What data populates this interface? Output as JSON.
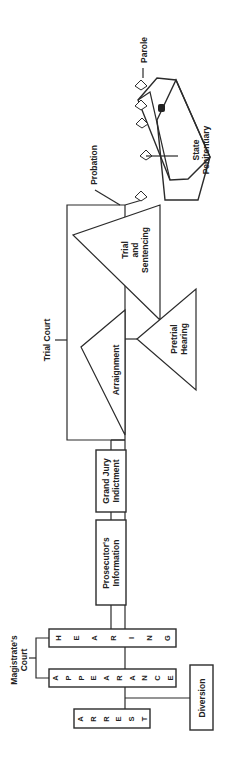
{
  "diagram": {
    "orientation": "rotated 90 degrees counter-clockwise",
    "colors": {
      "line": "#2b2b2b",
      "text": "#222222",
      "background": "#ffffff"
    },
    "groups": {
      "magistrates_court": {
        "line1": "Magistrate's",
        "line2": "Court"
      },
      "trial_court": {
        "label": "Trial Court"
      }
    },
    "nodes": {
      "arrest": {
        "letters": [
          "A",
          "R",
          "R",
          "E",
          "S",
          "T"
        ],
        "label": "ARREST"
      },
      "appearance": {
        "letters": [
          "A",
          "P",
          "P",
          "E",
          "A",
          "R",
          "A",
          "N",
          "C",
          "E"
        ],
        "label": "APPEARANCE"
      },
      "hearing": {
        "letters": [
          "H",
          "E",
          "A",
          "R",
          "I",
          "N",
          "G"
        ],
        "label": "HEARING"
      },
      "diversion": {
        "label": "Diversion"
      },
      "prosecutors_information": {
        "line1": "Prosecutor's",
        "line2": "Information"
      },
      "grand_jury_indictment": {
        "line1": "Grand Jury",
        "line2": "Indictment"
      },
      "arraignment": {
        "label": "Arraignment"
      },
      "pretrial_hearing": {
        "line1": "Pretrial",
        "line2": "Hearing"
      },
      "trial_and_sentencing": {
        "line1": "Trial",
        "line2": "and",
        "line3": "Sentencing"
      },
      "probation": {
        "label": "Probation"
      },
      "state_penitentiary": {
        "line1": "State",
        "line2": "Penitentiary"
      },
      "parole": {
        "label": "Parole"
      }
    }
  }
}
